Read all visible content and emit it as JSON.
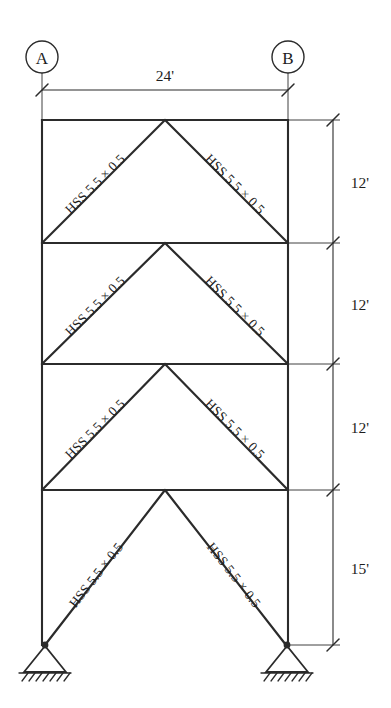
{
  "figure": {
    "background_color": "#ffffff",
    "ink_color": "#2b2b2b"
  },
  "gridlines": [
    {
      "id": "A",
      "label": "A",
      "x": 42
    },
    {
      "id": "B",
      "label": "B",
      "x": 288
    }
  ],
  "span": {
    "label": "24'",
    "value": 24,
    "unit": "ft",
    "from_gridline": "A",
    "to_gridline": "B"
  },
  "stories": [
    {
      "name": "story-4",
      "height_label": "12'",
      "height_value": 12,
      "unit": "ft",
      "brace_left_label": "HSS 5.5 × 0.5",
      "brace_right_label": "HSS 5.5 × 0.5"
    },
    {
      "name": "story-3",
      "height_label": "12'",
      "height_value": 12,
      "unit": "ft",
      "brace_left_label": "HSS 5.5 × 0.5",
      "brace_right_label": "HSS 5.5 × 0.5"
    },
    {
      "name": "story-2",
      "height_label": "12'",
      "height_value": 12,
      "unit": "ft",
      "brace_left_label": "HSS 5.5 × 0.5",
      "brace_right_label": "HSS 5.5 × 0.5"
    },
    {
      "name": "story-1",
      "height_label": "15'",
      "height_value": 15,
      "unit": "ft",
      "brace_left_label": "HSS 5.5 × 0.5",
      "brace_right_label": "HSS 5.5 × 0.5"
    }
  ],
  "supports": [
    {
      "name": "support-a",
      "type": "pinned",
      "gridline": "A"
    },
    {
      "name": "support-b",
      "type": "pinned",
      "gridline": "B"
    }
  ]
}
